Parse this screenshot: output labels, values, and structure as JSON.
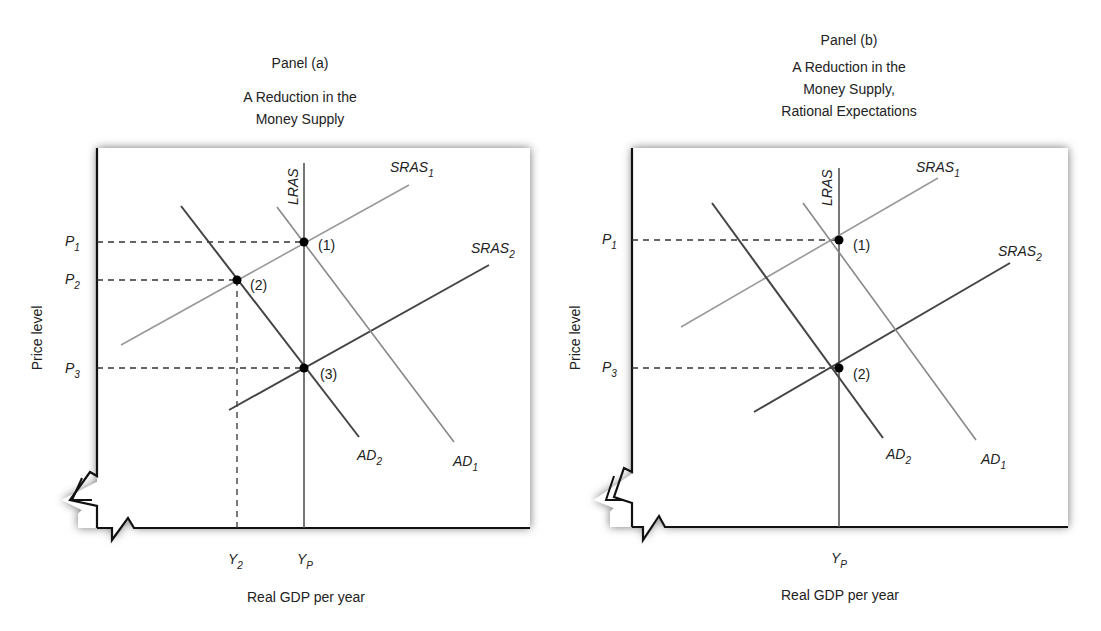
{
  "panels": [
    {
      "id": "a",
      "panel_label": "Panel (a)",
      "title_lines": [
        "A Reduction in the",
        "Money Supply"
      ],
      "y_axis_label": "Price level",
      "x_axis_label": "Real GDP per year",
      "price_ticks": [
        {
          "name": "P",
          "sub": "1"
        },
        {
          "name": "P",
          "sub": "2"
        },
        {
          "name": "P",
          "sub": "3"
        }
      ],
      "gdp_ticks": [
        {
          "name": "Y",
          "sub": "2"
        },
        {
          "name": "Y",
          "sub": "P"
        }
      ],
      "curves": {
        "lras": "LRAS",
        "sras1": {
          "name": "SRAS",
          "sub": "1"
        },
        "sras2": {
          "name": "SRAS",
          "sub": "2"
        },
        "ad1": {
          "name": "AD",
          "sub": "1"
        },
        "ad2": {
          "name": "AD",
          "sub": "2"
        }
      },
      "points": [
        "(1)",
        "(2)",
        "(3)"
      ]
    },
    {
      "id": "b",
      "panel_label": "Panel (b)",
      "title_lines": [
        "A Reduction in the",
        "Money Supply,",
        "Rational Expectations"
      ],
      "y_axis_label": "Price level",
      "x_axis_label": "Real GDP per year",
      "price_ticks": [
        {
          "name": "P",
          "sub": "1"
        },
        {
          "name": "P",
          "sub": "3"
        }
      ],
      "gdp_ticks": [
        {
          "name": "Y",
          "sub": "P"
        }
      ],
      "curves": {
        "lras": "LRAS",
        "sras1": {
          "name": "SRAS",
          "sub": "1"
        },
        "sras2": {
          "name": "SRAS",
          "sub": "2"
        },
        "ad1": {
          "name": "AD",
          "sub": "1"
        },
        "ad2": {
          "name": "AD",
          "sub": "2"
        }
      },
      "points": [
        "(1)",
        "(2)"
      ]
    }
  ],
  "colors": {
    "axis": "#111111",
    "dark_line": "#444444",
    "light_line": "#8a8a8a",
    "point": "#000000",
    "shadow": "#9a9a9a"
  }
}
